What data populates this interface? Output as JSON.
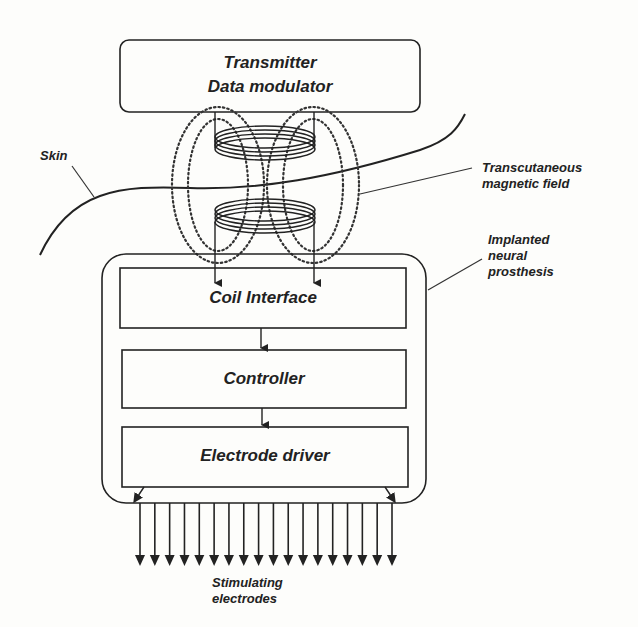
{
  "diagram": {
    "transmitter": {
      "line1": "Transmitter",
      "line2": "Data modulator"
    },
    "labels": {
      "skin": "Skin",
      "field_line1": "Transcutaneous",
      "field_line2": "magnetic field",
      "implant_line1": "Implanted",
      "implant_line2": "neural",
      "implant_line3": "prosthesis",
      "electrodes_line1": "Stimulating",
      "electrodes_line2": "electrodes"
    },
    "blocks": [
      {
        "label": "Coil Interface"
      },
      {
        "label": "Controller"
      },
      {
        "label": "Electrode driver"
      }
    ],
    "electrode_count": 18,
    "colors": {
      "stroke": "#222222",
      "background": "#fdfdfb"
    }
  }
}
